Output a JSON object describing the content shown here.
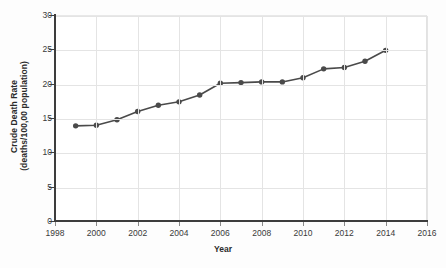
{
  "chart_data": {
    "type": "line",
    "title": "",
    "xlabel": "Year",
    "ylabel": "Crude Death Rate (deaths/100,00 population)",
    "ylabel_lines": [
      "Crude Death Rate",
      "(deaths/100,00 population)"
    ],
    "xlim": [
      1998,
      2016
    ],
    "ylim": [
      0,
      30
    ],
    "xticks": [
      1998,
      2000,
      2002,
      2004,
      2006,
      2008,
      2010,
      2012,
      2014,
      2016
    ],
    "yticks": [
      0,
      5,
      10,
      15,
      20,
      25,
      30
    ],
    "xtick_labels": [
      "1998",
      "2000",
      "2002",
      "2004",
      "2006",
      "2008",
      "2010",
      "2012",
      "2014",
      "2016"
    ],
    "ytick_labels": [
      "0",
      "5",
      "10",
      "15",
      "20",
      "25",
      "30"
    ],
    "grid": true,
    "grid_axes": "both",
    "legend": false,
    "legend_position": "none",
    "marker": "circle",
    "line_color": "#4a4a4a",
    "marker_color": "#4a4a4a",
    "x": [
      1999,
      2000,
      2001,
      2002,
      2003,
      2004,
      2005,
      2006,
      2007,
      2008,
      2009,
      2010,
      2011,
      2012,
      2013,
      2014
    ],
    "values": [
      14.0,
      14.1,
      14.9,
      16.1,
      17.0,
      17.5,
      18.5,
      20.2,
      20.3,
      20.4,
      20.4,
      21.0,
      22.3,
      22.5,
      23.4,
      25.0
    ],
    "series": [
      {
        "name": "Crude Death Rate",
        "values": [
          14.0,
          14.1,
          14.9,
          16.1,
          17.0,
          17.5,
          18.5,
          20.2,
          20.3,
          20.4,
          20.4,
          21.0,
          22.3,
          22.5,
          23.4,
          25.0
        ]
      }
    ]
  },
  "colors": {
    "line": "#4a4a4a",
    "marker": "#4a4a4a",
    "grid": "#e4e4e4",
    "axis": "#3d3d3d",
    "text": "#2b2b2b",
    "background": "#ffffff"
  }
}
